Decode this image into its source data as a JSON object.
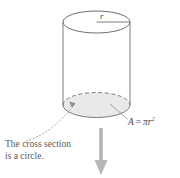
{
  "figure": {
    "shape": "cylinder",
    "labels": {
      "radius": "r",
      "area_formula_lhs": "A",
      "area_formula_eq": "=",
      "area_formula_pi": "π",
      "area_formula_var": "r",
      "area_formula_exponent": "2",
      "caption_line_1": "The cross section",
      "caption_line_2": "is a circle."
    },
    "colors": {
      "outline": "#6e6e6e",
      "cross_section_fill": "#e8e8e8",
      "cross_section_edge": "#8a8a8a",
      "arrow": "#b3b3b3",
      "text": "#5a5a5a",
      "background": "#ffffff",
      "leader_line": "#9a9a9a"
    },
    "geometry": {
      "top_ellipse_cx": 96.5,
      "top_ellipse_cy": 22,
      "top_ellipse_rx": 33.5,
      "top_ellipse_ry": 11,
      "bottom_ellipse_cx": 96.5,
      "bottom_ellipse_cy": 105,
      "bottom_ellipse_rx": 33.5,
      "bottom_ellipse_ry": 12.5,
      "left_side_x": 63,
      "right_side_x": 130,
      "arrow_x": 101,
      "arrow_top_y": 128,
      "arrow_bottom_y": 175
    }
  }
}
